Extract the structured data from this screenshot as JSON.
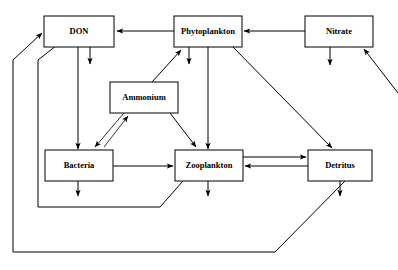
{
  "diagram": {
    "type": "box-and-arrow flow diagram",
    "background_color": "#ffffff",
    "line_color": "#000000",
    "nodes": [
      {
        "id": "don",
        "label": "DON",
        "x": 44,
        "y": 16,
        "w": 70,
        "h": 31
      },
      {
        "id": "phytoplankton",
        "label": "Phytoplankton",
        "x": 174,
        "y": 16,
        "w": 68,
        "h": 31
      },
      {
        "id": "nitrate",
        "label": "Nitrate",
        "x": 305,
        "y": 16,
        "w": 68,
        "h": 31
      },
      {
        "id": "ammonium",
        "label": "Ammonium",
        "x": 110,
        "y": 82,
        "w": 68,
        "h": 31
      },
      {
        "id": "bacteria",
        "label": "Bacteria",
        "x": 45,
        "y": 150,
        "w": 68,
        "h": 31
      },
      {
        "id": "zooplankton",
        "label": "Zooplankton",
        "x": 175,
        "y": 150,
        "w": 68,
        "h": 31
      },
      {
        "id": "detritus",
        "label": "Detritus",
        "x": 308,
        "y": 150,
        "w": 64,
        "h": 31
      }
    ],
    "edges": [
      {
        "id": "nitrate-to-phytoplankton",
        "from": "nitrate",
        "to": "phytoplankton",
        "kind": "straight"
      },
      {
        "id": "phytoplankton-to-don",
        "from": "phytoplankton",
        "to": "don",
        "kind": "straight"
      },
      {
        "id": "nitrate-sink",
        "from": "nitrate",
        "to": "external",
        "kind": "sink"
      },
      {
        "id": "external-to-nitrate",
        "from": "external",
        "to": "nitrate",
        "kind": "source"
      },
      {
        "id": "don-sink",
        "from": "don",
        "to": "external",
        "kind": "sink"
      },
      {
        "id": "phytoplankton-sink",
        "from": "phytoplankton",
        "to": "external",
        "kind": "sink"
      },
      {
        "id": "don-to-bacteria",
        "from": "don",
        "to": "bacteria",
        "kind": "straight"
      },
      {
        "id": "ammonium-to-phytoplankton",
        "from": "ammonium",
        "to": "phytoplankton",
        "kind": "diagonal"
      },
      {
        "id": "bacteria-to-ammonium",
        "from": "bacteria",
        "to": "ammonium",
        "kind": "diagonal"
      },
      {
        "id": "ammonium-to-bacteria",
        "from": "ammonium",
        "to": "bacteria",
        "kind": "diagonal"
      },
      {
        "id": "ammonium-to-zooplankton",
        "from": "ammonium",
        "to": "zooplankton",
        "kind": "diagonal"
      },
      {
        "id": "phytoplankton-to-zooplankton",
        "from": "phytoplankton",
        "to": "zooplankton",
        "kind": "straight"
      },
      {
        "id": "phytoplankton-to-detritus",
        "from": "phytoplankton",
        "to": "detritus",
        "kind": "diagonal"
      },
      {
        "id": "bacteria-to-zooplankton",
        "from": "bacteria",
        "to": "zooplankton",
        "kind": "straight"
      },
      {
        "id": "zooplankton-to-detritus",
        "from": "zooplankton",
        "to": "detritus",
        "kind": "straight"
      },
      {
        "id": "detritus-to-zooplankton",
        "from": "detritus",
        "to": "zooplankton",
        "kind": "straight"
      },
      {
        "id": "bacteria-sink",
        "from": "bacteria",
        "to": "external",
        "kind": "sink"
      },
      {
        "id": "zooplankton-sink",
        "from": "zooplankton",
        "to": "external",
        "kind": "sink"
      },
      {
        "id": "detritus-sink",
        "from": "detritus",
        "to": "external",
        "kind": "sink"
      },
      {
        "id": "zooplankton-to-don-loop",
        "from": "zooplankton",
        "to": "don",
        "kind": "routed-loop"
      },
      {
        "id": "detritus-to-don-loop",
        "from": "detritus",
        "to": "don",
        "kind": "routed-loop"
      }
    ]
  }
}
